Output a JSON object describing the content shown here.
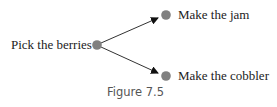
{
  "figure": {
    "caption": "Figure 7.5",
    "node_color": "#808080",
    "edge_color": "#333333",
    "nodes": [
      {
        "id": "pick",
        "label": "Pick the berries"
      },
      {
        "id": "jam",
        "label": "Make the jam"
      },
      {
        "id": "cobbler",
        "label": "Make the cobbler"
      }
    ],
    "edges": [
      {
        "from": "pick",
        "to": "jam"
      },
      {
        "from": "pick",
        "to": "cobbler"
      }
    ]
  }
}
